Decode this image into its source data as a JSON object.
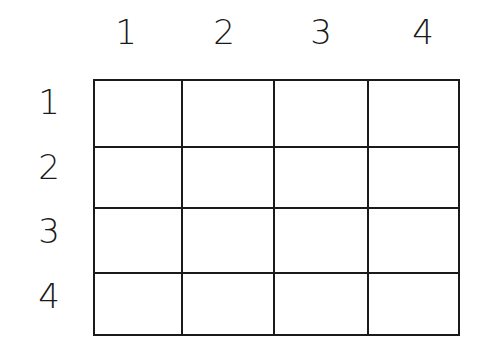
{
  "grid": {
    "rows": 4,
    "cols": 4,
    "column_labels": [
      "1",
      "2",
      "3",
      "4"
    ],
    "row_labels": [
      "1",
      "2",
      "3",
      "4"
    ],
    "cells": [
      [
        "",
        "",
        "",
        ""
      ],
      [
        "",
        "",
        "",
        ""
      ],
      [
        "",
        "",
        "",
        ""
      ],
      [
        "",
        "",
        "",
        ""
      ]
    ],
    "line_color": "#1a1a1a",
    "background_color": "#ffffff"
  }
}
